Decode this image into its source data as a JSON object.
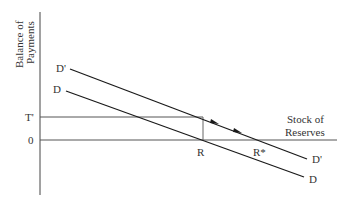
{
  "diagram": {
    "y_axis_label_line1": "Balance of",
    "y_axis_label_line2": "Payments",
    "x_axis_label_line1": "Stock of",
    "x_axis_label_line2": "Reserves",
    "tick_t_prime": "T'",
    "tick_zero": "0",
    "point_r": "R",
    "point_r_star": "R*",
    "curve_d_prime_start": "D'",
    "curve_d_prime_end": "D'",
    "curve_d_start": "D",
    "curve_d_end": "D",
    "colors": {
      "axis": "#444444",
      "curve": "#1a1a1a",
      "guide": "#666666",
      "text": "#333333"
    }
  }
}
